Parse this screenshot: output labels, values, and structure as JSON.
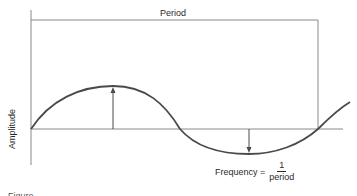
{
  "diagram": {
    "type": "sine-wave-annotation",
    "labels": {
      "period": "Period",
      "amplitude": "Amplitude",
      "frequency_prefix": "Frequency =",
      "frequency_numerator": "1",
      "frequency_denominator": "period"
    },
    "caption": "Figure",
    "colors": {
      "curve": "#4a4a4a",
      "axes": "#8a8a8a",
      "text": "#2a2a2a"
    }
  }
}
